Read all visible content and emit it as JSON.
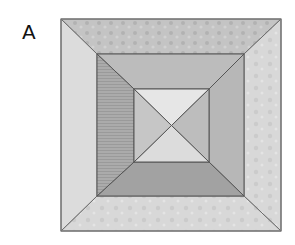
{
  "figure": {
    "label": "A",
    "rings": [
      {
        "name": "outer",
        "bounds": [
          61,
          19,
          281,
          231
        ],
        "colors": {
          "top": "#c3c3c3",
          "right": "#d5d5d5",
          "bottom": "#d3d3d3",
          "left": "#dcdcdc"
        }
      },
      {
        "name": "middle",
        "bounds": [
          97,
          54,
          244,
          196
        ],
        "colors": {
          "top": "#bcbcbc",
          "right": "#b7b7b7",
          "bottom": "#a2a2a2",
          "left": "#a9a9a9"
        }
      },
      {
        "name": "inner",
        "bounds": [
          134,
          89,
          209,
          162
        ],
        "colors": {
          "top": "#e6e6e6",
          "right": "#bdbdbd",
          "bottom": "#dcdcdc",
          "left": "#c6c6c6"
        }
      }
    ],
    "stroke_color": "#6b6b6b"
  }
}
